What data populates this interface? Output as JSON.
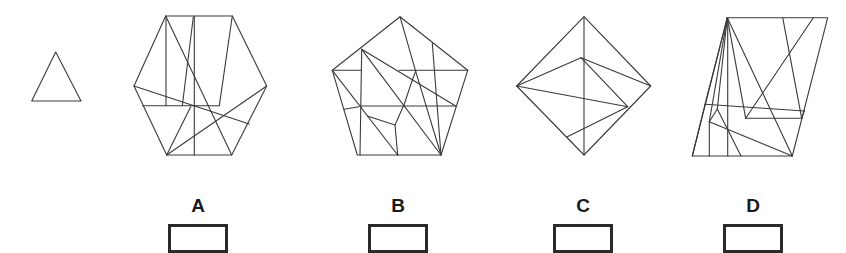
{
  "puzzle": {
    "type": "hidden-figure",
    "target_shape": {
      "name": "triangle",
      "points": [
        [
          55.7,
          52
        ],
        [
          31.7,
          101
        ],
        [
          81,
          101
        ]
      ]
    },
    "options": [
      {
        "label": "A",
        "shape": "hexagon",
        "outline": [
          [
            165.7,
            16
          ],
          [
            232.3,
            16
          ],
          [
            266.7,
            86
          ],
          [
            231.7,
            155
          ],
          [
            166.7,
            155
          ],
          [
            134,
            86
          ]
        ],
        "lines": [
          [
            [
              166,
              16
            ],
            [
              166,
              105.7
            ]
          ],
          [
            [
              142.7,
              105.7
            ],
            [
              219.3,
              105.7
            ]
          ],
          [
            [
              232.3,
              16
            ],
            [
              219.3,
              105.7
            ]
          ],
          [
            [
              194.3,
              16
            ],
            [
              194.3,
              155
            ]
          ],
          [
            [
              193.3,
              17
            ],
            [
              182.3,
              105.7
            ]
          ],
          [
            [
              165.7,
              16
            ],
            [
              231.7,
              155
            ]
          ],
          [
            [
              134,
              86
            ],
            [
              249.3,
              124
            ]
          ],
          [
            [
              166.7,
              155
            ],
            [
              266.7,
              86
            ]
          ],
          [
            [
              166.7,
              155
            ],
            [
              190.7,
              106.7
            ]
          ]
        ]
      },
      {
        "label": "B",
        "shape": "pentagon",
        "outline": [
          [
            400,
            16.7
          ],
          [
            467.7,
            70.3
          ],
          [
            441,
            155
          ],
          [
            357.3,
            155
          ],
          [
            332.3,
            70.3
          ]
        ],
        "lines": [
          [
            [
              361.7,
              49.3
            ],
            [
              360,
              155
            ]
          ],
          [
            [
              332.3,
              70.3
            ],
            [
              360.7,
              70.3
            ]
          ],
          [
            [
              399,
              70.3
            ],
            [
              467.7,
              70.3
            ]
          ],
          [
            [
              361.7,
              49.3
            ],
            [
              441,
              155
            ]
          ],
          [
            [
              361.7,
              49.3
            ],
            [
              455.7,
              106
            ]
          ],
          [
            [
              360,
              106
            ],
            [
              455.7,
              106
            ]
          ],
          [
            [
              332.3,
              70.3
            ],
            [
              397.7,
              155
            ]
          ],
          [
            [
              344,
              109.3
            ],
            [
              359,
              106.7
            ]
          ],
          [
            [
              400,
              16.7
            ],
            [
              415.7,
              71.3
            ]
          ],
          [
            [
              415.7,
              71.3
            ],
            [
              441,
              155
            ]
          ],
          [
            [
              415.7,
              71.3
            ],
            [
              412.3,
              80
            ],
            [
              404.3,
              104
            ],
            [
              395,
              125
            ],
            [
              397.7,
              155
            ]
          ],
          [
            [
              367.3,
              116
            ],
            [
              395,
              125
            ]
          ],
          [
            [
              432.3,
              43.3
            ],
            [
              441,
              155
            ]
          ]
        ]
      },
      {
        "label": "C",
        "shape": "diamond",
        "outline": [
          [
            584,
            16.7
          ],
          [
            650.7,
            86
          ],
          [
            584,
            155
          ],
          [
            516.7,
            86
          ]
        ],
        "lines": [
          [
            [
              584,
              16.7
            ],
            [
              584,
              155
            ]
          ],
          [
            [
              516.7,
              86
            ],
            [
              581,
              57.7
            ]
          ],
          [
            [
              581,
              57.7
            ],
            [
              650.7,
              86
            ]
          ],
          [
            [
              581,
              57.7
            ],
            [
              627.7,
              106.7
            ]
          ],
          [
            [
              516.7,
              86
            ],
            [
              627.7,
              106.7
            ]
          ],
          [
            [
              627.7,
              106.7
            ],
            [
              567.3,
              136.7
            ]
          ]
        ]
      },
      {
        "label": "D",
        "shape": "parallelogram",
        "outline": [
          [
            727.3,
            17.7
          ],
          [
            827.7,
            17.7
          ],
          [
            792.3,
            156
          ],
          [
            692.3,
            156
          ]
        ],
        "lines": [
          [
            [
              705,
              104.3
            ],
            [
              804.3,
              111
            ]
          ],
          [
            [
              709.3,
              121.7
            ],
            [
              709.3,
              156
            ]
          ],
          [
            [
              727.3,
              17.7
            ],
            [
              709.3,
              121.7
            ]
          ],
          [
            [
              727.7,
              17.7
            ],
            [
              727.7,
              156
            ]
          ],
          [
            [
              727.3,
              17.7
            ],
            [
              705,
              104.3
            ]
          ],
          [
            [
              705,
              104.3
            ],
            [
              692.3,
              156
            ]
          ],
          [
            [
              709.3,
              121.7
            ],
            [
              792.3,
              156
            ]
          ],
          [
            [
              727.3,
              17.7
            ],
            [
              717.3,
              109
            ]
          ],
          [
            [
              709.3,
              121.7
            ],
            [
              717.3,
              109
            ]
          ],
          [
            [
              717.3,
              109
            ],
            [
              741,
              156
            ]
          ],
          [
            [
              727.3,
              17.7
            ],
            [
              745.7,
              118.3
            ]
          ],
          [
            [
              745.7,
              118.3
            ],
            [
              801.7,
              118.3
            ]
          ],
          [
            [
              801.7,
              118.3
            ],
            [
              782.7,
              17.7
            ]
          ],
          [
            [
              745.7,
              118.3
            ],
            [
              813.3,
              17.7
            ]
          ],
          [
            [
              727.3,
              17.7
            ],
            [
              792.3,
              156
            ]
          ],
          [
            [
              804.3,
              111
            ],
            [
              801.7,
              118.3
            ]
          ]
        ]
      }
    ],
    "answer_boxes": [
      {
        "label": "A",
        "x": 168,
        "value": ""
      },
      {
        "label": "B",
        "x": 368,
        "value": ""
      },
      {
        "label": "C",
        "x": 553,
        "value": ""
      },
      {
        "label": "D",
        "x": 723,
        "value": ""
      }
    ],
    "colors": {
      "stroke": "#3a3a3a",
      "box_border": "#2a2a2a",
      "background": "#ffffff"
    }
  }
}
